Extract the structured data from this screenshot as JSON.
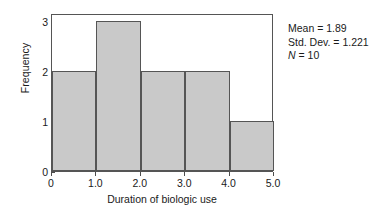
{
  "chart_data": {
    "type": "bar",
    "subtype": "histogram",
    "title": "",
    "subtitle": "",
    "xlabel": "Duration of biologic use",
    "ylabel": "Frequency",
    "categories": [
      "0.0–1.0",
      "1.0–2.0",
      "2.0–3.0",
      "3.0–4.0",
      "4.0–5.0"
    ],
    "bin_edges": [
      0,
      1,
      2,
      3,
      4,
      5
    ],
    "values": [
      2,
      3,
      2,
      2,
      1
    ],
    "bars": [
      {
        "bin_start": 0,
        "bin_end": 1,
        "value": 2
      },
      {
        "bin_start": 1,
        "bin_end": 2,
        "value": 3
      },
      {
        "bin_start": 2,
        "bin_end": 3,
        "value": 2
      },
      {
        "bin_start": 3,
        "bin_end": 4,
        "value": 2
      },
      {
        "bin_start": 4,
        "bin_end": 5,
        "value": 1
      }
    ],
    "xlim": [
      0,
      5
    ],
    "ylim": [
      0,
      3.15
    ],
    "xticks": [
      0,
      1,
      2,
      3,
      4,
      5
    ],
    "xtick_labels": [
      "0",
      "1.0",
      "2.0",
      "3.0",
      "4.0",
      "5.0"
    ],
    "yticks": [
      0,
      1,
      2,
      3
    ],
    "ytick_labels": [
      "0",
      "1",
      "2",
      "3"
    ],
    "grid": false,
    "legend": false,
    "bar_fill_color": "#c9c9c9",
    "bar_edge_color": "#555555",
    "frame_color": "#555555",
    "background_color": "#ffffff"
  },
  "annotations": {
    "stats": [
      {
        "label": "Mean",
        "separator": " = ",
        "value": "1.89",
        "italic_label": false
      },
      {
        "label": "Std. Dev.",
        "separator": " = ",
        "value": "1.221",
        "italic_label": false
      },
      {
        "label": "N",
        "separator": " = ",
        "value": "10",
        "italic_label": true
      }
    ],
    "stats_lines": [
      "Mean = 1.89",
      "Std. Dev. = 1.221",
      "N = 10"
    ]
  }
}
